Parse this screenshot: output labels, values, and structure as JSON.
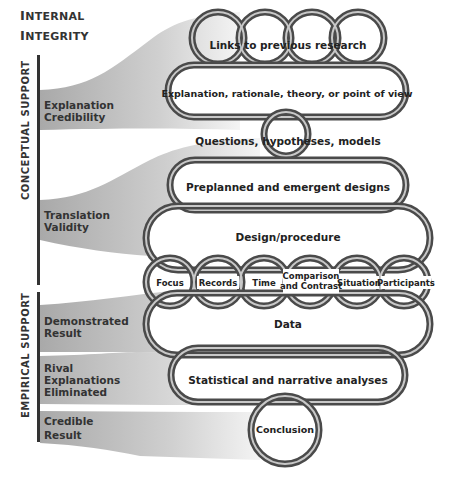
{
  "header": {
    "line1_first": "I",
    "line1_rest": "NTERNAL",
    "line2_first": "I",
    "line2_rest": "NTEGRITY"
  },
  "axis_groups": [
    {
      "label": "CONCEPTUAL SUPPORT"
    },
    {
      "label": "EMPIRICAL SUPPORT"
    }
  ],
  "criteria": [
    {
      "lines": [
        "Explanation",
        "Credibility"
      ]
    },
    {
      "lines": [
        "Translation",
        "Validity"
      ]
    },
    {
      "lines": [
        "Demonstrated",
        "Result"
      ]
    },
    {
      "lines": [
        "Rival",
        "Explanations",
        "Eliminated"
      ]
    },
    {
      "lines": [
        "Credible",
        "Result"
      ]
    }
  ],
  "chain": {
    "links_to_previous_research": "Links to previous research",
    "explanation": "Explanation, rationale, theory, or point of view",
    "questions": "Questions, hypotheses, models",
    "preplanned": "Preplanned and emergent designs",
    "design_procedure": "Design/procedure",
    "facets": [
      {
        "label": "Focus"
      },
      {
        "label": "Records"
      },
      {
        "label": "Time"
      },
      {
        "label": "Comparison\nand Contrast",
        "line1": "Comparison",
        "line2": "and Contrast"
      },
      {
        "label": "Situation"
      },
      {
        "label": "Participants"
      }
    ],
    "data": "Data",
    "analyses": "Statistical and narrative analyses",
    "conclusion": "Conclusion"
  },
  "colors": {
    "band_gray": "#b5b5b5",
    "ring_dark": "#4a4a4a",
    "ring_light": "#c8c8c8",
    "text": "#333333"
  }
}
